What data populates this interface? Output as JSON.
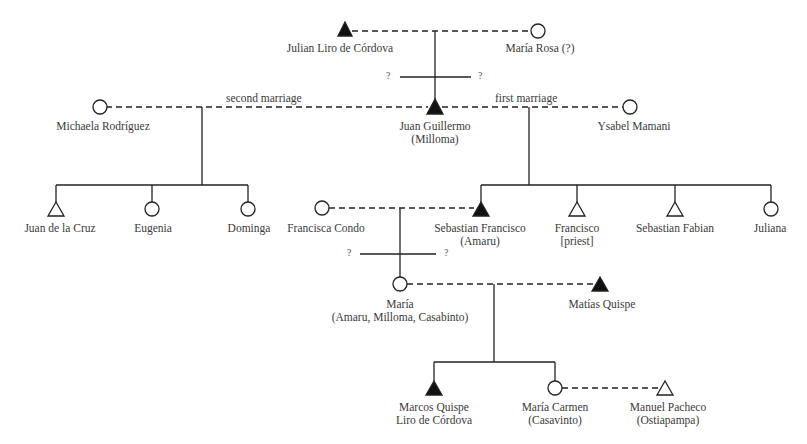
{
  "diagram": {
    "type": "kinship-chart",
    "legend": {
      "filled_triangle": "male (filled)",
      "open_triangle": "male",
      "open_circle": "female",
      "dashed_line": "marriage",
      "solid_line": "descent"
    },
    "unknown_marker": "?",
    "people": [
      {
        "id": "julian",
        "name": "Julian Liro de Córdova",
        "sex": "male",
        "filled": true
      },
      {
        "id": "maria_rosa",
        "name": "María Rosa (?)",
        "sex": "female",
        "filled": false
      },
      {
        "id": "michaela",
        "name": "Michaela Rodríguez",
        "sex": "female",
        "filled": false
      },
      {
        "id": "juan_guillermo",
        "name": "Juan Guillermo",
        "sub": "(Milloma)",
        "sex": "male",
        "filled": true
      },
      {
        "id": "ysabel",
        "name": "Ysabel Mamani",
        "sex": "female",
        "filled": false
      },
      {
        "id": "juan_cruz",
        "name": "Juan de la Cruz",
        "sex": "male",
        "filled": false
      },
      {
        "id": "eugenia",
        "name": "Eugenia",
        "sex": "female",
        "filled": false
      },
      {
        "id": "dominga",
        "name": "Dominga",
        "sex": "female",
        "filled": false
      },
      {
        "id": "francisca",
        "name": "Francisca Condo",
        "sex": "female",
        "filled": false
      },
      {
        "id": "sebastian_francisco",
        "name": "Sebastian Francisco",
        "sub": "(Amaru)",
        "sex": "male",
        "filled": true
      },
      {
        "id": "francisco",
        "name": "Francisco",
        "sub": "[priest]",
        "sex": "male",
        "filled": false
      },
      {
        "id": "sebastian_fabian",
        "name": "Sebastian Fabian",
        "sex": "male",
        "filled": false
      },
      {
        "id": "juliana",
        "name": "Juliana",
        "sex": "female",
        "filled": false
      },
      {
        "id": "maria",
        "name": "María",
        "sub": "(Amaru, Milloma, Casabinto)",
        "sex": "female",
        "filled": false
      },
      {
        "id": "matias",
        "name": "Matías Quispe",
        "sex": "male",
        "filled": true
      },
      {
        "id": "marcos",
        "name": "Marcos Quispe",
        "sub": "Liro de Córdova",
        "sex": "male",
        "filled": true
      },
      {
        "id": "maria_carmen",
        "name": "María Carmen",
        "sub": "(Casavinto)",
        "sex": "female",
        "filled": false
      },
      {
        "id": "manuel",
        "name": "Manuel Pacheco",
        "sub": "(Ostiapampa)",
        "sex": "male",
        "filled": false
      }
    ],
    "marriages": [
      {
        "a": "julian",
        "b": "maria_rosa",
        "label": ""
      },
      {
        "a": "michaela",
        "b": "juan_guillermo",
        "label": "second marriage"
      },
      {
        "a": "juan_guillermo",
        "b": "ysabel",
        "label": "first marriage"
      },
      {
        "a": "francisca",
        "b": "sebastian_francisco",
        "label": ""
      },
      {
        "a": "maria",
        "b": "matias",
        "label": ""
      },
      {
        "a": "maria_carmen",
        "b": "manuel",
        "label": ""
      }
    ],
    "marriage_labels": {
      "second": "second marriage",
      "first": "first marriage"
    }
  }
}
